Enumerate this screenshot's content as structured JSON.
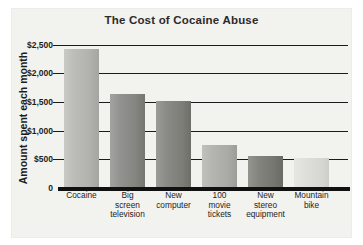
{
  "chart_data": {
    "type": "bar",
    "title": "The Cost of Cocaine Abuse",
    "xlabel": "",
    "ylabel": "Amount spent each month",
    "categories": [
      "Cocaine",
      "Big screen television",
      "New computer",
      "100 movie tickets",
      "New stereo equipment",
      "Mountain bike"
    ],
    "category_lines": [
      [
        "Cocaine"
      ],
      [
        "Big",
        "screen",
        "television"
      ],
      [
        "New",
        "computer"
      ],
      [
        "100",
        "movie",
        "tickets"
      ],
      [
        "New",
        "stereo",
        "equipment"
      ],
      [
        "Mountain",
        "bike"
      ]
    ],
    "values": [
      2430,
      1635,
      1525,
      750,
      560,
      520
    ],
    "ylim": [
      0,
      2500
    ],
    "yticks": [
      0,
      500,
      1000,
      1500,
      2000,
      2500
    ],
    "ytick_labels": [
      "0",
      "$500",
      "$1,000",
      "$1,500",
      "$2,000",
      "$2,500"
    ],
    "grid": true,
    "legend": "none",
    "bar_colors": [
      "#b9b9b5",
      "#8e8e8a",
      "#848480",
      "#b0b0ac",
      "#7e7e7a",
      "#dcdcd8"
    ],
    "axis_color": "#111111",
    "text_color": "#1d1d1d",
    "panel_color": "#f2f2ef",
    "background_color": "#ffffff"
  }
}
